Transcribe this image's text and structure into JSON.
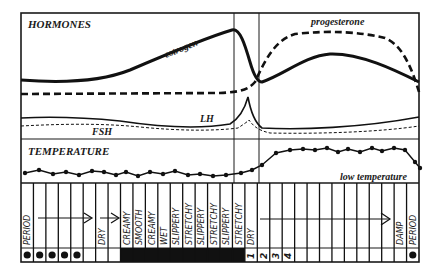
{
  "hormones": {
    "title": "HORMONES",
    "labels": {
      "estrogen": "estrogen",
      "progesterone": "progesterone",
      "lh": "LH",
      "fsh": "FSH"
    }
  },
  "temperature": {
    "title": "TEMPERATURE",
    "note": "low temperature",
    "points": [
      [
        25,
        173
      ],
      [
        39,
        170
      ],
      [
        53,
        174
      ],
      [
        66,
        172
      ],
      [
        79,
        175
      ],
      [
        92,
        171
      ],
      [
        104,
        172
      ],
      [
        116,
        175
      ],
      [
        126,
        172
      ],
      [
        138,
        176
      ],
      [
        150,
        172
      ],
      [
        163,
        174
      ],
      [
        175,
        171
      ],
      [
        188,
        175
      ],
      [
        200,
        174
      ],
      [
        213,
        176
      ],
      [
        226,
        175
      ],
      [
        241,
        173
      ],
      [
        252,
        170
      ],
      [
        262,
        165
      ],
      [
        276,
        153
      ],
      [
        290,
        150
      ],
      [
        303,
        149
      ],
      [
        315,
        150
      ],
      [
        327,
        148
      ],
      [
        338,
        152
      ],
      [
        348,
        149
      ],
      [
        360,
        152
      ],
      [
        372,
        148
      ],
      [
        382,
        151
      ],
      [
        394,
        148
      ],
      [
        405,
        150
      ],
      [
        415,
        162
      ],
      [
        420,
        168
      ]
    ]
  },
  "mucus": {
    "columns": 32,
    "labels": [
      {
        "col": 0,
        "text": "PERIOD"
      },
      {
        "col": 6,
        "text": "DRY"
      },
      {
        "col": 8,
        "text": "CREAMY"
      },
      {
        "col": 9,
        "text": "SMOOTH"
      },
      {
        "col": 10,
        "text": "CREAMY"
      },
      {
        "col": 11,
        "text": "WET"
      },
      {
        "col": 12,
        "text": "SLIPPERY"
      },
      {
        "col": 13,
        "text": "STRETCHY"
      },
      {
        "col": 14,
        "text": "SLIPPERY"
      },
      {
        "col": 15,
        "text": "STRETCHY"
      },
      {
        "col": 16,
        "text": "SLIPPERY"
      },
      {
        "col": 17,
        "text": "STRETCHY"
      },
      {
        "col": 18,
        "text": "DRY"
      },
      {
        "col": 30,
        "text": "DAMP"
      },
      {
        "col": 31,
        "text": "PERIOD"
      }
    ],
    "bleeding_days": [
      0,
      1,
      2,
      3,
      4,
      31
    ],
    "fertile_days_start": 8,
    "fertile_days_end": 17,
    "post_peak_counts": [
      {
        "col": 18,
        "text": "1"
      },
      {
        "col": 19,
        "text": "2"
      },
      {
        "col": 20,
        "text": "3"
      },
      {
        "col": 21,
        "text": "4"
      }
    ]
  }
}
